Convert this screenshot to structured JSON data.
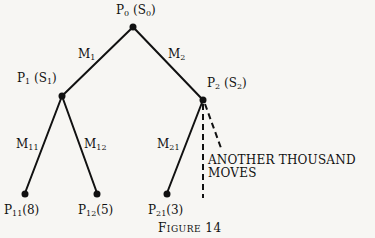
{
  "figure": {
    "caption_first": "F",
    "caption_rest": "IGURE",
    "caption_number": "14"
  },
  "nodes": {
    "root": {
      "label": "P",
      "sub": "0",
      "state": "S",
      "state_sub": "0"
    },
    "p1": {
      "label": "P",
      "sub": "1",
      "state": "S",
      "state_sub": "1"
    },
    "p2": {
      "label": "P",
      "sub": "2",
      "state": "S",
      "state_sub": "2"
    },
    "p11": {
      "label": "P",
      "sub": "11",
      "value": "(8)"
    },
    "p12": {
      "label": "P",
      "sub": "12",
      "value": "(5)"
    },
    "p21": {
      "label": "P",
      "sub": "21",
      "value": "(3)"
    }
  },
  "edges": {
    "m1": {
      "label": "M",
      "sub": "1"
    },
    "m2": {
      "label": "M",
      "sub": "2"
    },
    "m11": {
      "label": "M",
      "sub": "11"
    },
    "m12": {
      "label": "M",
      "sub": "12"
    },
    "m21": {
      "label": "M",
      "sub": "21"
    }
  },
  "annotation": {
    "line1": "ANOTHER THOUSAND",
    "line2": "MOVES"
  }
}
